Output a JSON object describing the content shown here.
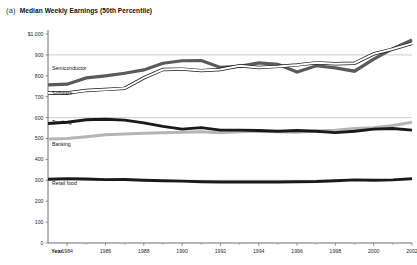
{
  "panel": {
    "letter": "(a)",
    "title": "Median Weekly Earnings (50th Percentile)"
  },
  "axes": {
    "y_top_label": "$1,000",
    "x_axis_name": "Year",
    "y_ticks": [
      "$1,000",
      "900",
      "800",
      "700",
      "600",
      "500",
      "400",
      "300",
      "200",
      "100",
      "0"
    ],
    "x_ticks": [
      "1984",
      "1986",
      "1988",
      "1990",
      "1992",
      "1994",
      "1996",
      "1998",
      "2000",
      "2002"
    ]
  },
  "chart_data": {
    "type": "line",
    "title": "Median Weekly Earnings (50th Percentile)",
    "xlabel": "Year",
    "ylabel": "",
    "ylim": [
      0,
      1000
    ],
    "xlim": [
      1983,
      2002
    ],
    "ytick_step": 100,
    "gridlines": [
      300,
      600,
      900
    ],
    "grid": true,
    "legend": "inline-labels",
    "x": [
      1983,
      1984,
      1985,
      1986,
      1987,
      1988,
      1989,
      1990,
      1991,
      1992,
      1993,
      1994,
      1995,
      1996,
      1997,
      1998,
      1999,
      2000,
      2001,
      2002
    ],
    "series": [
      {
        "name": "Semiconductor",
        "color": "#5a5a5a",
        "style": "thick-gray",
        "values": [
          757,
          760,
          790,
          800,
          812,
          828,
          860,
          872,
          873,
          840,
          845,
          862,
          855,
          818,
          848,
          838,
          822,
          880,
          930,
          972
        ]
      },
      {
        "name": "Software",
        "color": "#ffffff",
        "outline": "#1a1a1a",
        "style": "white-outlined",
        "values": [
          718,
          718,
          730,
          735,
          740,
          790,
          830,
          832,
          825,
          830,
          848,
          840,
          845,
          852,
          862,
          858,
          860,
          905,
          928,
          955
        ]
      },
      {
        "name": "Trucking",
        "color": "#1a1a1a",
        "style": "thick-black",
        "values": [
          572,
          578,
          590,
          592,
          588,
          575,
          558,
          545,
          552,
          540,
          540,
          538,
          535,
          538,
          535,
          528,
          535,
          545,
          548,
          540
        ]
      },
      {
        "name": "Banking",
        "color": "#b5b5b5",
        "style": "thick-lightgray",
        "values": [
          498,
          500,
          508,
          518,
          522,
          525,
          528,
          530,
          532,
          528,
          532,
          535,
          532,
          530,
          536,
          540,
          548,
          552,
          562,
          578
        ]
      },
      {
        "name": "Retail food",
        "color": "#1a1a1a",
        "style": "thick-black",
        "values": [
          305,
          308,
          306,
          303,
          304,
          300,
          298,
          296,
          293,
          292,
          292,
          292,
          292,
          293,
          294,
          298,
          302,
          300,
          302,
          308
        ]
      }
    ]
  },
  "series_labels": [
    {
      "name": "Semiconductor"
    },
    {
      "name": "Software"
    },
    {
      "name": "Trucking"
    },
    {
      "name": "Banking"
    },
    {
      "name": "Retail food"
    }
  ]
}
